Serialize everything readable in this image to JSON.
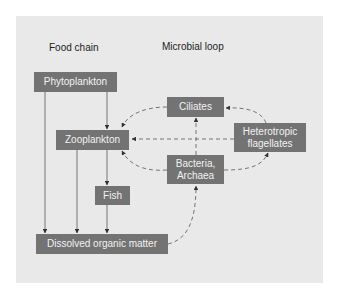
{
  "diagram": {
    "headings": {
      "food_chain": "Food chain",
      "microbial_loop": "Microbial loop"
    },
    "nodes": {
      "phytoplankton": "Phytoplankton",
      "zooplankton": "Zooplankton",
      "fish": "Fish",
      "dom": "Dissolved organic matter",
      "ciliates": "Ciliates",
      "flagellates_line1": "Heterotropic",
      "flagellates_line2": "flagellates",
      "bacteria_line1": "Bacteria,",
      "bacteria_line2": "Archaea"
    },
    "edges": [
      {
        "from": "Phytoplankton",
        "to": "Zooplankton",
        "style": "solid"
      },
      {
        "from": "Phytoplankton",
        "to": "Dissolved organic matter",
        "style": "solid"
      },
      {
        "from": "Zooplankton",
        "to": "Fish",
        "style": "solid"
      },
      {
        "from": "Zooplankton",
        "to": "Dissolved organic matter",
        "style": "solid"
      },
      {
        "from": "Fish",
        "to": "Dissolved organic matter",
        "style": "solid"
      },
      {
        "from": "Dissolved organic matter",
        "to": "Bacteria, Archaea",
        "style": "dashed"
      },
      {
        "from": "Bacteria, Archaea",
        "to": "Zooplankton",
        "style": "dashed"
      },
      {
        "from": "Bacteria, Archaea",
        "to": "Ciliates",
        "style": "dashed"
      },
      {
        "from": "Bacteria, Archaea",
        "to": "Heterotropic flagellates",
        "style": "dashed"
      },
      {
        "from": "Heterotropic flagellates",
        "to": "Ciliates",
        "style": "dashed"
      },
      {
        "from": "Heterotropic flagellates",
        "to": "Zooplankton",
        "style": "dashed"
      },
      {
        "from": "Ciliates",
        "to": "Zooplankton",
        "style": "dashed"
      }
    ],
    "colors": {
      "background": "#e9e9e9",
      "box": "#737373",
      "box_text": "#f2f2f2",
      "line": "#555555"
    }
  }
}
